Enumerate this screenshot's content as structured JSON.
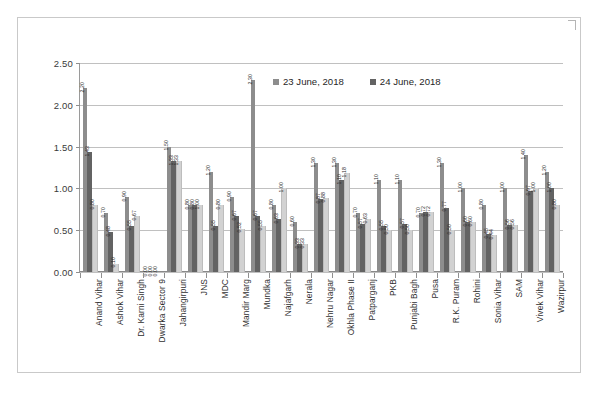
{
  "chart_data": {
    "type": "bar",
    "title": "",
    "xlabel": "",
    "ylabel": "",
    "ylim": [
      0.0,
      2.5
    ],
    "ytick_labels": [
      "0.00",
      "0.50",
      "1.00",
      "1.50",
      "2.00",
      "2.50"
    ],
    "ytick_values": [
      0.0,
      0.5,
      1.0,
      1.5,
      2.0,
      2.5
    ],
    "grid": true,
    "legend_position": "top-center",
    "legend": [
      "23 June, 2018",
      "24 June, 2018"
    ],
    "categories": [
      "Anand Vihar",
      "Ashok Vihar",
      "Dr. Karni Singh",
      "Dwarka Sector 9",
      "Jahangirpuri",
      "JNS",
      "MDC",
      "Mandir Marg",
      "Mundka",
      "Najafgarh",
      "Nerala",
      "Nehru Nagar",
      "Okhla Phase II",
      "Patparganj",
      "PKB",
      "Punjabi Bagh",
      "Pusa",
      "R.K. Puram",
      "Rohini",
      "Sonia Vihar",
      "SAM",
      "Vivek Vihar",
      "Wazirpur"
    ],
    "series": [
      {
        "name": "23 June, 2018",
        "values": [
          2.2,
          0.7,
          0.9,
          0.0,
          1.5,
          0.8,
          1.2,
          0.9,
          2.3,
          0.8,
          0.6,
          1.3,
          1.3,
          0.7,
          1.1,
          1.1,
          0.7,
          1.3,
          1.0,
          0.8,
          1.0,
          1.4,
          1.2
        ]
      },
      {
        "name": "24 June, 2018",
        "values": [
          1.43,
          0.48,
          0.55,
          0.0,
          1.33,
          0.8,
          0.55,
          0.67,
          0.67,
          0.63,
          0.33,
          0.87,
          1.1,
          0.57,
          0.55,
          0.57,
          0.72,
          0.77,
          0.6,
          0.45,
          0.56,
          0.97,
          1.0
        ]
      },
      {
        "name": "series-3",
        "values": [
          0.8,
          0.1,
          0.67,
          0.0,
          1.33,
          0.8,
          0.8,
          0.52,
          0.55,
          1.0,
          0.33,
          0.88,
          1.18,
          0.63,
          0.5,
          0.5,
          0.72,
          0.5,
          0.6,
          0.44,
          0.56,
          1.0,
          0.8
        ]
      }
    ],
    "bar_labels": [
      [
        "2.20",
        "1.43",
        "0.80"
      ],
      [
        "0.70",
        "0.48",
        "0.10"
      ],
      [
        "0.90",
        "0.55",
        "0.67"
      ],
      [
        "0.00",
        "0.00",
        "0.00"
      ],
      [
        "1.50",
        "1.33",
        "1.33"
      ],
      [
        "0.80",
        "0.80",
        "1.00"
      ],
      [
        "1.20",
        "0.55",
        "0.80"
      ],
      [
        "0.90",
        "0.67",
        "0.52"
      ],
      [
        "2.30",
        "0.67",
        "0.55"
      ],
      [
        "0.80",
        "0.63",
        "1.00"
      ],
      [
        "0.60",
        "0.33",
        "0.33"
      ],
      [
        "1.30",
        "0.87",
        "0.88"
      ],
      [
        "1.30",
        "1.10",
        "1.18"
      ],
      [
        "0.70",
        "0.57",
        "0.63"
      ],
      [
        "1.10",
        "0.55",
        "0.50"
      ],
      [
        "1.10",
        "0.57",
        "0.50"
      ],
      [
        "0.70",
        "0.72",
        "0.72"
      ],
      [
        "1.30",
        "0.77",
        "0.50"
      ],
      [
        "1.00",
        "0.60",
        "0.60"
      ],
      [
        "0.80",
        "0.45",
        "0.44"
      ],
      [
        "1.00",
        "0.56",
        "0.56"
      ],
      [
        "1.40",
        "0.97",
        "1.00"
      ],
      [
        "1.20",
        "1.00",
        "0.80"
      ]
    ],
    "colors": {
      "series_1": "#8d8d8d",
      "series_2": "#636363",
      "series_3": "#d2d2d2",
      "grid": "#c0c0c0",
      "axis": "#8a8a8a",
      "text": "#2b2b2b",
      "background": "#ffffff"
    }
  }
}
